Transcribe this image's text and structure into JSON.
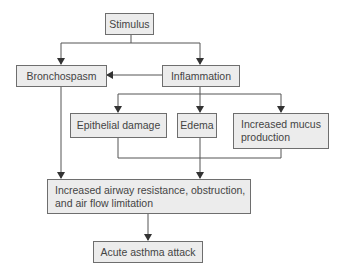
{
  "diagram": {
    "type": "flowchart",
    "colors": {
      "box_fill": "#ececec",
      "box_border": "#6e6e6e",
      "line": "#555555",
      "text": "#444444"
    },
    "nodes": {
      "stimulus": {
        "label": "Stimulus"
      },
      "bronchospasm": {
        "label": "Bronchospasm"
      },
      "inflammation": {
        "label": "Inflammation"
      },
      "epithelial_damage": {
        "label": "Epithelial damage"
      },
      "edema": {
        "label": "Edema"
      },
      "mucus": {
        "label": "Increased mucus production"
      },
      "airway": {
        "label": "Increased airway resistance, obstruction, and air flow limitation"
      },
      "acute": {
        "label": "Acute asthma attack"
      }
    },
    "edges": [
      {
        "from": "Stimulus",
        "to": "Bronchospasm"
      },
      {
        "from": "Stimulus",
        "to": "Inflammation"
      },
      {
        "from": "Inflammation",
        "to": "Bronchospasm"
      },
      {
        "from": "Inflammation",
        "to": "Epithelial damage"
      },
      {
        "from": "Inflammation",
        "to": "Edema"
      },
      {
        "from": "Inflammation",
        "to": "Increased mucus production"
      },
      {
        "from": "Bronchospasm",
        "to": "Increased airway resistance, obstruction, and air flow limitation"
      },
      {
        "from": "Epithelial damage + Edema + Increased mucus production",
        "to": "Increased airway resistance, obstruction, and air flow limitation"
      },
      {
        "from": "Increased airway resistance, obstruction, and air flow limitation",
        "to": "Acute asthma attack"
      }
    ]
  }
}
